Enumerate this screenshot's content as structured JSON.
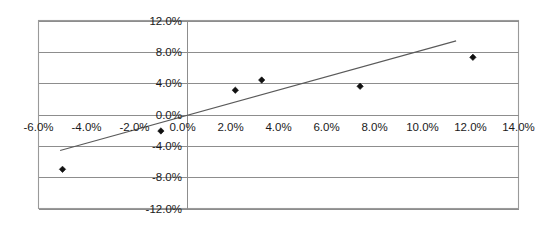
{
  "chart_data": {
    "type": "scatter",
    "title": "",
    "subtitle": "",
    "xlabel": "",
    "ylabel": "",
    "xlim": [
      -6.0,
      14.0
    ],
    "ylim": [
      -12.0,
      12.0
    ],
    "grid": "horizontal",
    "legend": "none",
    "x_tick_labels": [
      "-6.0%",
      "-4.0%",
      "-2.0%",
      "0.0%",
      "2.0%",
      "4.0%",
      "6.0%",
      "8.0%",
      "10.0%",
      "12.0%",
      "14.0%"
    ],
    "x_tick_values": [
      -6.0,
      -4.0,
      -2.0,
      0.0,
      2.0,
      4.0,
      6.0,
      8.0,
      10.0,
      12.0,
      14.0
    ],
    "y_tick_labels": [
      "12.0%",
      "8.0%",
      "4.0%",
      "0.0%",
      "-4.0%",
      "-8.0%",
      "-12.0%"
    ],
    "y_tick_values": [
      12.0,
      8.0,
      4.0,
      0.0,
      -4.0,
      -8.0,
      -12.0
    ],
    "series": [
      {
        "name": "observations",
        "marker": "diamond",
        "color": "#111111",
        "points": [
          {
            "x": -5.0,
            "y": -7.0
          },
          {
            "x": -0.9,
            "y": -2.1
          },
          {
            "x": 2.2,
            "y": 3.1
          },
          {
            "x": 3.3,
            "y": 4.4
          },
          {
            "x": 7.4,
            "y": 3.6
          },
          {
            "x": 12.1,
            "y": 7.3
          }
        ]
      }
    ],
    "trendline": {
      "name": "linear-fit",
      "color": "#5a5a5a",
      "x_start": -5.1,
      "y_start": -4.6,
      "x_end": 11.4,
      "y_end": 9.4
    }
  },
  "axes": {
    "x_axis_name": "horizontal-percent-axis",
    "y_axis_name": "vertical-percent-axis"
  }
}
